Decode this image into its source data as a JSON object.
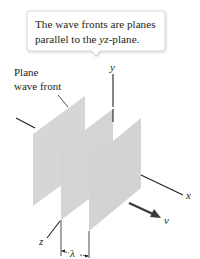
{
  "callout": {
    "line1": "The wave fronts are planes",
    "line2_prefix": "parallel to the ",
    "line2_italic": "yz",
    "line2_suffix": "-plane."
  },
  "label": {
    "line1": "Plane",
    "line2": "wave front"
  },
  "axes": {
    "x": "x",
    "y": "y",
    "z": "z"
  },
  "velocity_label": "v",
  "wavelength_label": "λ",
  "colors": {
    "plane_fill": "#d4d4d4",
    "line": "#231f20",
    "callout_border": "#c9c9c9"
  }
}
